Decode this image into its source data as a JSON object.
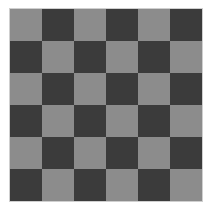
{
  "board": {
    "rows": 6,
    "cols": 6,
    "colors": {
      "light": "#8c8c8c",
      "dark": "#3b3b3b"
    },
    "top_left": "light"
  }
}
